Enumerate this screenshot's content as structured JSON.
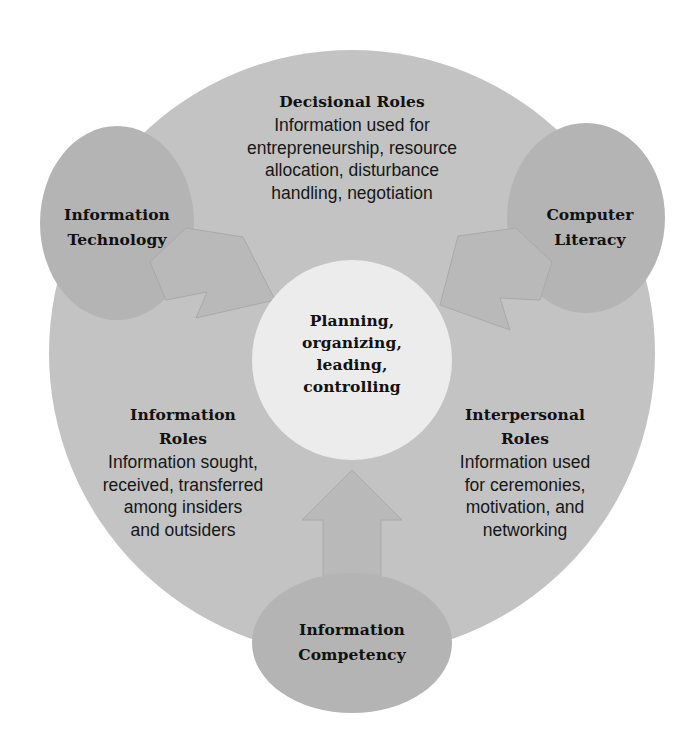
{
  "diagram": {
    "colors": {
      "background": "#ffffff",
      "outer_circle": "#c3c3c3",
      "satellite_circles": "#b4b4b4",
      "arrows": "#b9b9b9",
      "arrow_outline": "#a9a9a9",
      "center_circle": "#ececec",
      "text": "#111111"
    },
    "center": {
      "lines": [
        "Planning,",
        "organizing,",
        "leading,",
        "controlling"
      ]
    },
    "roles": {
      "decisional": {
        "title_lines": [
          "Decisional Roles"
        ],
        "body_lines": [
          "Information used for",
          "entrepreneurship, resource",
          "allocation, disturbance",
          "handling, negotiation"
        ]
      },
      "information": {
        "title_lines": [
          "Information",
          "Roles"
        ],
        "body_lines": [
          "Information sought,",
          "received, transferred",
          "among insiders",
          "and outsiders"
        ]
      },
      "interpersonal": {
        "title_lines": [
          "Interpersonal",
          "Roles"
        ],
        "body_lines": [
          "Information used",
          "for ceremonies,",
          "motivation, and",
          "networking"
        ]
      }
    },
    "inputs": {
      "information_technology": {
        "lines": [
          "Information",
          "Technology"
        ]
      },
      "computer_literacy": {
        "lines": [
          "Computer",
          "Literacy"
        ]
      },
      "information_competency": {
        "lines": [
          "Information",
          "Competency"
        ]
      }
    }
  }
}
